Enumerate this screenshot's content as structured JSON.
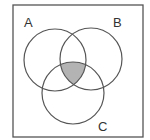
{
  "diagram": {
    "type": "venn",
    "sets": [
      {
        "label": "A",
        "cx": 55,
        "cy": 60,
        "r": 31,
        "label_x": 24,
        "label_y": 27
      },
      {
        "label": "B",
        "cx": 91,
        "cy": 59,
        "r": 31,
        "label_x": 113,
        "label_y": 27
      },
      {
        "label": "C",
        "cx": 73,
        "cy": 93,
        "r": 31,
        "label_x": 98,
        "label_y": 131
      }
    ],
    "shaded_region": "A ∩ B ∩ C",
    "colors": {
      "stroke": "#555555",
      "shade": "#b3b3b3",
      "border": "#555555",
      "background": "#ffffff"
    }
  }
}
